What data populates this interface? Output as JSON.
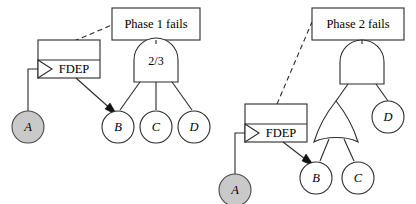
{
  "diagram": {
    "type": "dynamic-fault-tree",
    "background_color": "#ffffff",
    "line_color": "#2b2b2b",
    "event_fill_gray": "#c9c9c9",
    "event_fill_white": "#ffffff",
    "subdiagrams": [
      {
        "id": "phase-1",
        "top_event_label": "Phase 1 fails",
        "gate": {
          "id": "voting-gate-1",
          "kind": "voting",
          "label": "2/3",
          "inputs": [
            "B",
            "C",
            "D"
          ]
        },
        "fdep": {
          "label": "FDEP",
          "trigger": "A",
          "dependent": "B"
        },
        "events": [
          {
            "id": "A",
            "label": "A",
            "fill": "gray"
          },
          {
            "id": "B",
            "label": "B",
            "fill": "white"
          },
          {
            "id": "C",
            "label": "C",
            "fill": "white"
          },
          {
            "id": "D",
            "label": "D",
            "fill": "white"
          }
        ]
      },
      {
        "id": "phase-2",
        "top_event_label": "Phase 2 fails",
        "gate": {
          "id": "and-gate-2",
          "kind": "and",
          "label": "",
          "inputs": [
            "or-gate-2",
            "D"
          ]
        },
        "subgate": {
          "id": "or-gate-2",
          "kind": "or",
          "label": "",
          "inputs": [
            "B",
            "C"
          ]
        },
        "fdep": {
          "label": "FDEP",
          "trigger": "A",
          "dependent": "B"
        },
        "events": [
          {
            "id": "A",
            "label": "A",
            "fill": "gray"
          },
          {
            "id": "B",
            "label": "B",
            "fill": "white"
          },
          {
            "id": "C",
            "label": "C",
            "fill": "white"
          },
          {
            "id": "D",
            "label": "D",
            "fill": "white"
          }
        ]
      }
    ]
  },
  "labels": {
    "phase1_top": "Phase 1 fails",
    "phase2_top": "Phase 2 fails",
    "fdep1": "FDEP",
    "fdep2": "FDEP",
    "gate1_vote": "2/3",
    "p1_event_a": "A",
    "p1_event_b": "B",
    "p1_event_c": "C",
    "p1_event_d": "D",
    "p2_event_a": "A",
    "p2_event_b": "B",
    "p2_event_c": "C",
    "p2_event_d": "D"
  }
}
